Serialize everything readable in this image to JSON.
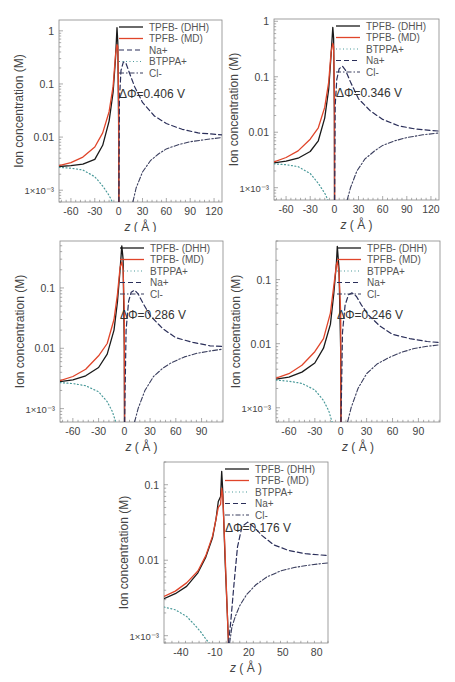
{
  "figure": {
    "ylabel": "Ion concentration (M)",
    "xlabel_italic": "z",
    "xlabel_unit": "( Å )",
    "legend_styles": {
      "TPFB- (DHH)": {
        "color": "#1a1a1a",
        "dash": "",
        "width": 1.3
      },
      "TPFB- (MD)": {
        "color": "#e0452a",
        "dash": "",
        "width": 1.3
      },
      "Na+": {
        "color": "#2b2f5a",
        "dash": "5,3",
        "width": 1.2
      },
      "BTPPA+": {
        "color": "#4a9a9a",
        "dash": "1,2.5",
        "width": 1.2
      },
      "Cl-": {
        "color": "#3b3f5f",
        "dash": "5,2,1.5,2",
        "width": 1.1
      }
    }
  },
  "chart_data": [
    {
      "type": "line",
      "title": "",
      "annotation": "ΔΦ=0.406 V",
      "xlabel": "z (Å)",
      "ylabel": "Ion concentration (M)",
      "yscale": "log",
      "xlim": [
        -75,
        130
      ],
      "ylim": [
        0.0006,
        1.6
      ],
      "xticks": [
        -60,
        -30,
        0,
        30,
        60,
        90,
        120
      ],
      "yticks": [
        {
          "v": 0.001,
          "label": "1×10⁻³"
        },
        {
          "v": 0.01,
          "label": "0.01"
        },
        {
          "v": 0.1,
          "label": "0.1"
        },
        {
          "v": 1,
          "label": "1"
        }
      ],
      "legend": [
        "TPFB- (DHH)",
        "TPFB- (MD)",
        "Na+",
        "BTPPA+",
        "Cl-"
      ],
      "legend_position": "upper right",
      "series": [
        {
          "name": "TPFB- (DHH)",
          "x": [
            -75,
            -60,
            -45,
            -30,
            -20,
            -12,
            -7,
            -4,
            -2,
            -1,
            0,
            0.2
          ],
          "y": [
            0.0028,
            0.0029,
            0.0031,
            0.0038,
            0.007,
            0.02,
            0.07,
            0.3,
            1.15,
            0.6,
            0.02,
            0.0006
          ]
        },
        {
          "name": "TPFB- (MD)",
          "x": [
            -75,
            -60,
            -45,
            -30,
            -20,
            -12,
            -7,
            -4,
            -2,
            -1,
            0,
            0.3
          ],
          "y": [
            0.0029,
            0.0033,
            0.0042,
            0.0065,
            0.012,
            0.03,
            0.09,
            0.35,
            0.55,
            0.5,
            0.05,
            0.0006
          ]
        },
        {
          "name": "Na+",
          "x": [
            0.3,
            1,
            3,
            6,
            9,
            13,
            20,
            30,
            45,
            60,
            80,
            100,
            130
          ],
          "y": [
            0.0006,
            0.05,
            0.18,
            0.26,
            0.25,
            0.17,
            0.09,
            0.045,
            0.025,
            0.018,
            0.014,
            0.012,
            0.011
          ]
        },
        {
          "name": "BTPPA+",
          "x": [
            -75,
            -60,
            -45,
            -30,
            -20,
            -12,
            -8,
            -5
          ],
          "y": [
            0.0027,
            0.0026,
            0.0024,
            0.0018,
            0.0012,
            0.0008,
            0.0006,
            0.0004
          ]
        },
        {
          "name": "Cl-",
          "x": [
            18,
            22,
            30,
            40,
            50,
            60,
            75,
            90,
            110,
            130
          ],
          "y": [
            0.0006,
            0.0011,
            0.0022,
            0.0036,
            0.0048,
            0.006,
            0.0072,
            0.0082,
            0.009,
            0.0098
          ]
        }
      ]
    },
    {
      "type": "line",
      "title": "",
      "annotation": "ΔΦ=0.346 V",
      "xlabel": "z (Å)",
      "ylabel": "Ion concentration (M)",
      "yscale": "log",
      "xlim": [
        -75,
        130
      ],
      "ylim": [
        0.0006,
        1.1
      ],
      "xticks": [
        -60,
        -30,
        0,
        30,
        60,
        90,
        120
      ],
      "yticks": [
        {
          "v": 0.001,
          "label": "1×10⁻³"
        },
        {
          "v": 0.01,
          "label": "0.01"
        },
        {
          "v": 0.1,
          "label": "0.1"
        },
        {
          "v": 1,
          "label": "1"
        }
      ],
      "legend": [
        "TPFB- (DHH)",
        "TPFB- (MD)",
        "BTPPA+",
        "Na+",
        "Cl-"
      ],
      "legend_position": "upper right",
      "series": [
        {
          "name": "TPFB- (DHH)",
          "x": [
            -75,
            -60,
            -45,
            -30,
            -20,
            -12,
            -7,
            -4,
            -2,
            -1,
            0,
            0.2
          ],
          "y": [
            0.0028,
            0.003,
            0.0034,
            0.0045,
            0.007,
            0.018,
            0.06,
            0.25,
            0.78,
            0.5,
            0.02,
            0.0006
          ]
        },
        {
          "name": "TPFB- (MD)",
          "x": [
            -75,
            -60,
            -45,
            -30,
            -20,
            -12,
            -7,
            -4,
            -2,
            -1,
            0,
            0.3
          ],
          "y": [
            0.0029,
            0.0035,
            0.0046,
            0.0075,
            0.012,
            0.028,
            0.08,
            0.28,
            0.4,
            0.35,
            0.05,
            0.0006
          ]
        },
        {
          "name": "BTPPA+",
          "x": [
            -75,
            -60,
            -45,
            -30,
            -20,
            -12,
            -8,
            -5
          ],
          "y": [
            0.0027,
            0.0026,
            0.0024,
            0.0018,
            0.0012,
            0.0008,
            0.0006,
            0.0004
          ]
        },
        {
          "name": "Na+",
          "x": [
            0.3,
            1,
            3,
            6,
            10,
            14,
            20,
            30,
            45,
            60,
            80,
            100,
            130
          ],
          "y": [
            0.0006,
            0.03,
            0.09,
            0.14,
            0.155,
            0.13,
            0.08,
            0.04,
            0.024,
            0.017,
            0.013,
            0.0115,
            0.0105
          ]
        },
        {
          "name": "Cl-",
          "x": [
            16,
            20,
            28,
            38,
            50,
            60,
            75,
            90,
            110,
            130
          ],
          "y": [
            0.0006,
            0.001,
            0.002,
            0.0033,
            0.0046,
            0.0058,
            0.007,
            0.008,
            0.009,
            0.0097
          ]
        }
      ]
    },
    {
      "type": "line",
      "title": "",
      "annotation": "ΔΦ=0.286 V",
      "xlabel": "z (Å)",
      "ylabel": "Ion concentration (M)",
      "yscale": "log",
      "xlim": [
        -75,
        115
      ],
      "ylim": [
        0.0006,
        0.6
      ],
      "xticks": [
        -60,
        -30,
        0,
        30,
        60,
        90
      ],
      "yticks": [
        {
          "v": 0.001,
          "label": "1×10⁻³"
        },
        {
          "v": 0.01,
          "label": "0.01"
        },
        {
          "v": 0.1,
          "label": "0.1"
        }
      ],
      "legend": [
        "TPFB- (DHH)",
        "TPFB- (MD)",
        "BTPPA+",
        "Na+",
        "Cl-"
      ],
      "legend_position": "upper right",
      "series": [
        {
          "name": "TPFB- (DHH)",
          "x": [
            -75,
            -60,
            -45,
            -30,
            -20,
            -12,
            -8,
            -5,
            -3,
            -1.5,
            0,
            0.2
          ],
          "y": [
            0.0028,
            0.003,
            0.0035,
            0.0048,
            0.008,
            0.02,
            0.06,
            0.2,
            0.5,
            0.3,
            0.01,
            0.0006
          ]
        },
        {
          "name": "TPFB- (MD)",
          "x": [
            -75,
            -60,
            -45,
            -30,
            -20,
            -12,
            -8,
            -5,
            -3,
            -1.5,
            0,
            0.3
          ],
          "y": [
            0.0029,
            0.0034,
            0.0045,
            0.0075,
            0.012,
            0.03,
            0.08,
            0.22,
            0.27,
            0.2,
            0.04,
            0.0006
          ]
        },
        {
          "name": "BTPPA+",
          "x": [
            -75,
            -60,
            -45,
            -30,
            -20,
            -14,
            -10,
            -7
          ],
          "y": [
            0.0027,
            0.0026,
            0.0024,
            0.0019,
            0.0013,
            0.0009,
            0.0006,
            0.0004
          ]
        },
        {
          "name": "Na+",
          "x": [
            0.3,
            2,
            5,
            8,
            12,
            16,
            22,
            30,
            45,
            60,
            80,
            100,
            115
          ],
          "y": [
            0.0006,
            0.02,
            0.06,
            0.085,
            0.092,
            0.08,
            0.055,
            0.035,
            0.021,
            0.015,
            0.0125,
            0.011,
            0.0107
          ]
        },
        {
          "name": "Cl-",
          "x": [
            12,
            16,
            24,
            34,
            45,
            55,
            70,
            85,
            100,
            115
          ],
          "y": [
            0.0006,
            0.001,
            0.002,
            0.0034,
            0.0047,
            0.0058,
            0.0072,
            0.0083,
            0.009,
            0.0097
          ]
        }
      ]
    },
    {
      "type": "line",
      "title": "",
      "annotation": "ΔΦ=0.246 V",
      "xlabel": "z (Å)",
      "ylabel": "Ion concentration (M)",
      "yscale": "log",
      "xlim": [
        -75,
        115
      ],
      "ylim": [
        0.0006,
        0.4
      ],
      "xticks": [
        -60,
        -30,
        0,
        30,
        60,
        90
      ],
      "yticks": [
        {
          "v": 0.001,
          "label": "1×10⁻³"
        },
        {
          "v": 0.01,
          "label": "0.01"
        },
        {
          "v": 0.1,
          "label": "0.1"
        }
      ],
      "legend": [
        "TPFB- (DHH)",
        "TPFB- (MD)",
        "BTPPA+",
        "Na+",
        "Cl-"
      ],
      "legend_position": "upper right",
      "series": [
        {
          "name": "TPFB- (DHH)",
          "x": [
            -75,
            -60,
            -45,
            -30,
            -20,
            -12,
            -8,
            -5,
            -4,
            -2,
            0,
            0.2
          ],
          "y": [
            0.0028,
            0.003,
            0.0036,
            0.005,
            0.0085,
            0.02,
            0.06,
            0.18,
            0.33,
            0.15,
            0.008,
            0.0006
          ]
        },
        {
          "name": "TPFB- (MD)",
          "x": [
            -75,
            -60,
            -45,
            -30,
            -20,
            -12,
            -8,
            -5,
            -4,
            -2,
            0,
            0.3
          ],
          "y": [
            0.0029,
            0.0034,
            0.0046,
            0.0075,
            0.012,
            0.03,
            0.08,
            0.17,
            0.19,
            0.13,
            0.03,
            0.0006
          ]
        },
        {
          "name": "BTPPA+",
          "x": [
            -75,
            -60,
            -45,
            -30,
            -20,
            -14,
            -10,
            -7
          ],
          "y": [
            0.0027,
            0.0026,
            0.0024,
            0.0019,
            0.0013,
            0.0009,
            0.0006,
            0.0004
          ]
        },
        {
          "name": "Na+",
          "x": [
            0.3,
            2,
            5,
            9,
            13,
            18,
            24,
            32,
            45,
            60,
            80,
            100,
            115
          ],
          "y": [
            0.0006,
            0.015,
            0.04,
            0.058,
            0.062,
            0.055,
            0.04,
            0.028,
            0.019,
            0.014,
            0.012,
            0.0108,
            0.0104
          ]
        },
        {
          "name": "Cl-",
          "x": [
            8,
            12,
            20,
            30,
            42,
            55,
            70,
            85,
            100,
            115
          ],
          "y": [
            0.0006,
            0.001,
            0.002,
            0.0034,
            0.0048,
            0.006,
            0.0073,
            0.0084,
            0.0091,
            0.0096
          ]
        }
      ]
    },
    {
      "type": "line",
      "title": "",
      "annotation": "ΔΦ=0.176 V",
      "xlabel": "z (Å)",
      "ylabel": "Ion concentration (M)",
      "yscale": "log",
      "xlim": [
        -55,
        90
      ],
      "ylim": [
        0.0008,
        0.2
      ],
      "xticks": [
        -40,
        -10,
        20,
        50,
        80
      ],
      "yticks": [
        {
          "v": 0.001,
          "label": "1×10⁻³"
        },
        {
          "v": 0.01,
          "label": "0.01"
        },
        {
          "v": 0.1,
          "label": "0.1"
        }
      ],
      "legend": [
        "TPFB- (DHH)",
        "TPFB- (MD)",
        "BTPPA+",
        "Na+",
        "Cl-"
      ],
      "legend_position": "upper right",
      "series": [
        {
          "name": "TPFB- (DHH)",
          "x": [
            -55,
            -45,
            -35,
            -25,
            -18,
            -12,
            -9,
            -7,
            -5,
            -4,
            -3,
            -1,
            1,
            2
          ],
          "y": [
            0.0031,
            0.0036,
            0.0045,
            0.0068,
            0.011,
            0.02,
            0.035,
            0.06,
            0.07,
            0.15,
            0.08,
            0.01,
            0.002,
            0.0008
          ]
        },
        {
          "name": "TPFB- (MD)",
          "x": [
            -55,
            -45,
            -35,
            -25,
            -18,
            -12,
            -9,
            -7,
            -5,
            -4,
            -3,
            -1,
            1,
            2
          ],
          "y": [
            0.0033,
            0.0039,
            0.005,
            0.0072,
            0.0115,
            0.021,
            0.035,
            0.05,
            0.055,
            0.09,
            0.07,
            0.012,
            0.002,
            0.0008
          ]
        },
        {
          "name": "BTPPA+",
          "x": [
            -55,
            -45,
            -35,
            -28,
            -22,
            -18,
            -15
          ],
          "y": [
            0.0024,
            0.0022,
            0.0018,
            0.0014,
            0.0011,
            0.0009,
            0.0008
          ]
        },
        {
          "name": "Na+",
          "x": [
            2,
            4,
            7,
            10,
            14,
            19,
            25,
            32,
            42,
            55,
            70,
            90
          ],
          "y": [
            0.0008,
            0.0015,
            0.005,
            0.015,
            0.028,
            0.032,
            0.027,
            0.021,
            0.016,
            0.0135,
            0.0122,
            0.0115
          ]
        },
        {
          "name": "Cl-",
          "x": [
            3,
            5,
            8,
            12,
            18,
            26,
            36,
            48,
            60,
            75,
            90
          ],
          "y": [
            0.0008,
            0.0013,
            0.0018,
            0.0025,
            0.0035,
            0.0047,
            0.006,
            0.0072,
            0.008,
            0.0087,
            0.0092
          ]
        }
      ]
    }
  ]
}
